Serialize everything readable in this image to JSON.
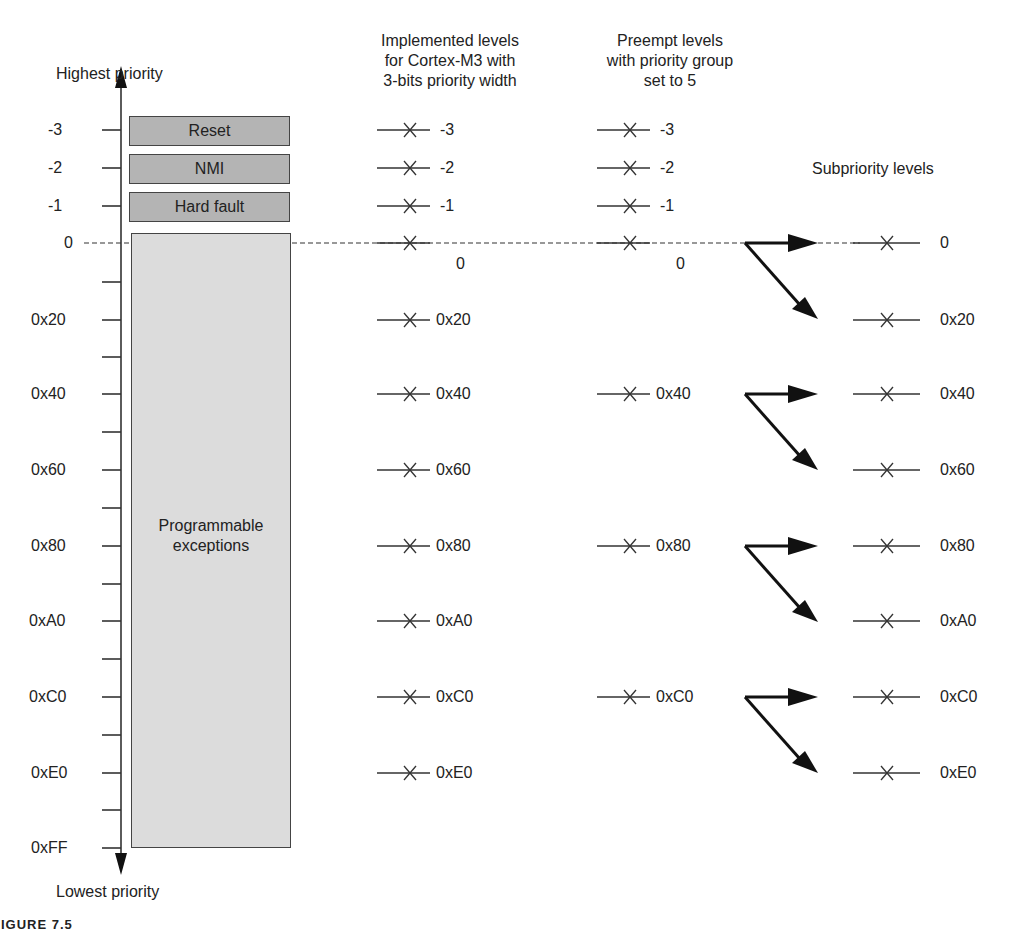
{
  "figure": {
    "axis": {
      "top_label": "Highest priority",
      "bottom_label": "Lowest priority",
      "ticks": [
        "-3",
        "-2",
        "-1",
        "0",
        "0x20",
        "0x40",
        "0x60",
        "0x80",
        "0xA0",
        "0xC0",
        "0xE0",
        "0xFF"
      ]
    },
    "exception_blocks": {
      "reset": "Reset",
      "nmi": "NMI",
      "hard_fault": "Hard fault",
      "programmable": "Programmable exceptions"
    },
    "columns": {
      "implemented": {
        "header": [
          "Implemented levels",
          "for Cortex-M3 with",
          "3-bits priority width"
        ],
        "levels": [
          "-3",
          "-2",
          "-1",
          "0",
          "0x20",
          "0x40",
          "0x60",
          "0x80",
          "0xA0",
          "0xC0",
          "0xE0"
        ]
      },
      "preempt": {
        "header": [
          "Preempt levels",
          "with priority group",
          "set to 5"
        ],
        "levels": [
          "-3",
          "-2",
          "-1",
          "0",
          "0x40",
          "0x80",
          "0xC0"
        ]
      },
      "subpriority": {
        "header": "Subpriority levels",
        "levels": [
          "0",
          "0x20",
          "0x40",
          "0x60",
          "0x80",
          "0xA0",
          "0xC0",
          "0xE0"
        ]
      }
    },
    "caption": "FIGURE 7.5"
  },
  "colors": {
    "line": "#333333",
    "fixed_block_fill": "#b4b4b4",
    "programmable_fill": "#dcdcdc"
  }
}
